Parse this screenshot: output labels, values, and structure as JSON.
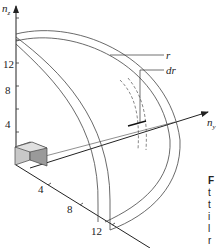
{
  "diagram": {
    "axes": {
      "z": {
        "label": "n",
        "subscript": "z",
        "ticks": [
          "4",
          "8",
          "12"
        ]
      },
      "y": {
        "label": "n",
        "subscript": "y"
      },
      "x": {
        "ticks": [
          "4",
          "8",
          "12"
        ]
      }
    },
    "annotations": {
      "r": "r",
      "dr": "dr"
    },
    "caption_fragment": [
      "F",
      "t",
      "t",
      "i",
      "l",
      "r"
    ],
    "colors": {
      "stroke": "#333333",
      "cube_light": "#c8c8c8",
      "cube_dark": "#9a9a9a"
    }
  }
}
